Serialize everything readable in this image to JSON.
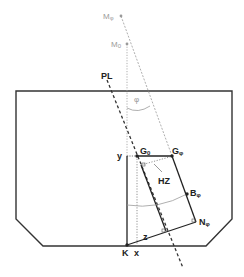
{
  "diagram": {
    "type": "ship-stability-heel-diagram",
    "colors": {
      "hull": "#333333",
      "lines": "#222222",
      "guides": "#9a9a9a"
    },
    "labels": {
      "PL": "PL",
      "M_phi": "M",
      "M_phi_sub": "φ",
      "M_0": "M",
      "M_0_sub": "0",
      "phi": "φ",
      "G_0": "G",
      "G_0_sub": "0",
      "G_phi": "G",
      "G_phi_sub": "φ",
      "y": "y",
      "HZ": "HZ",
      "B_phi": "B",
      "B_phi_sub": "φ",
      "N_phi": "N",
      "N_phi_sub": "φ",
      "K": "K",
      "x": "x",
      "z": "z"
    },
    "points": {
      "M_phi": [
        121,
        16
      ],
      "M_0": [
        127,
        44
      ],
      "G_0": [
        137,
        156
      ],
      "G_phi": [
        172,
        156
      ],
      "B_phi": [
        187,
        194
      ],
      "N_phi": [
        195,
        222
      ],
      "K": [
        127,
        245
      ]
    }
  }
}
